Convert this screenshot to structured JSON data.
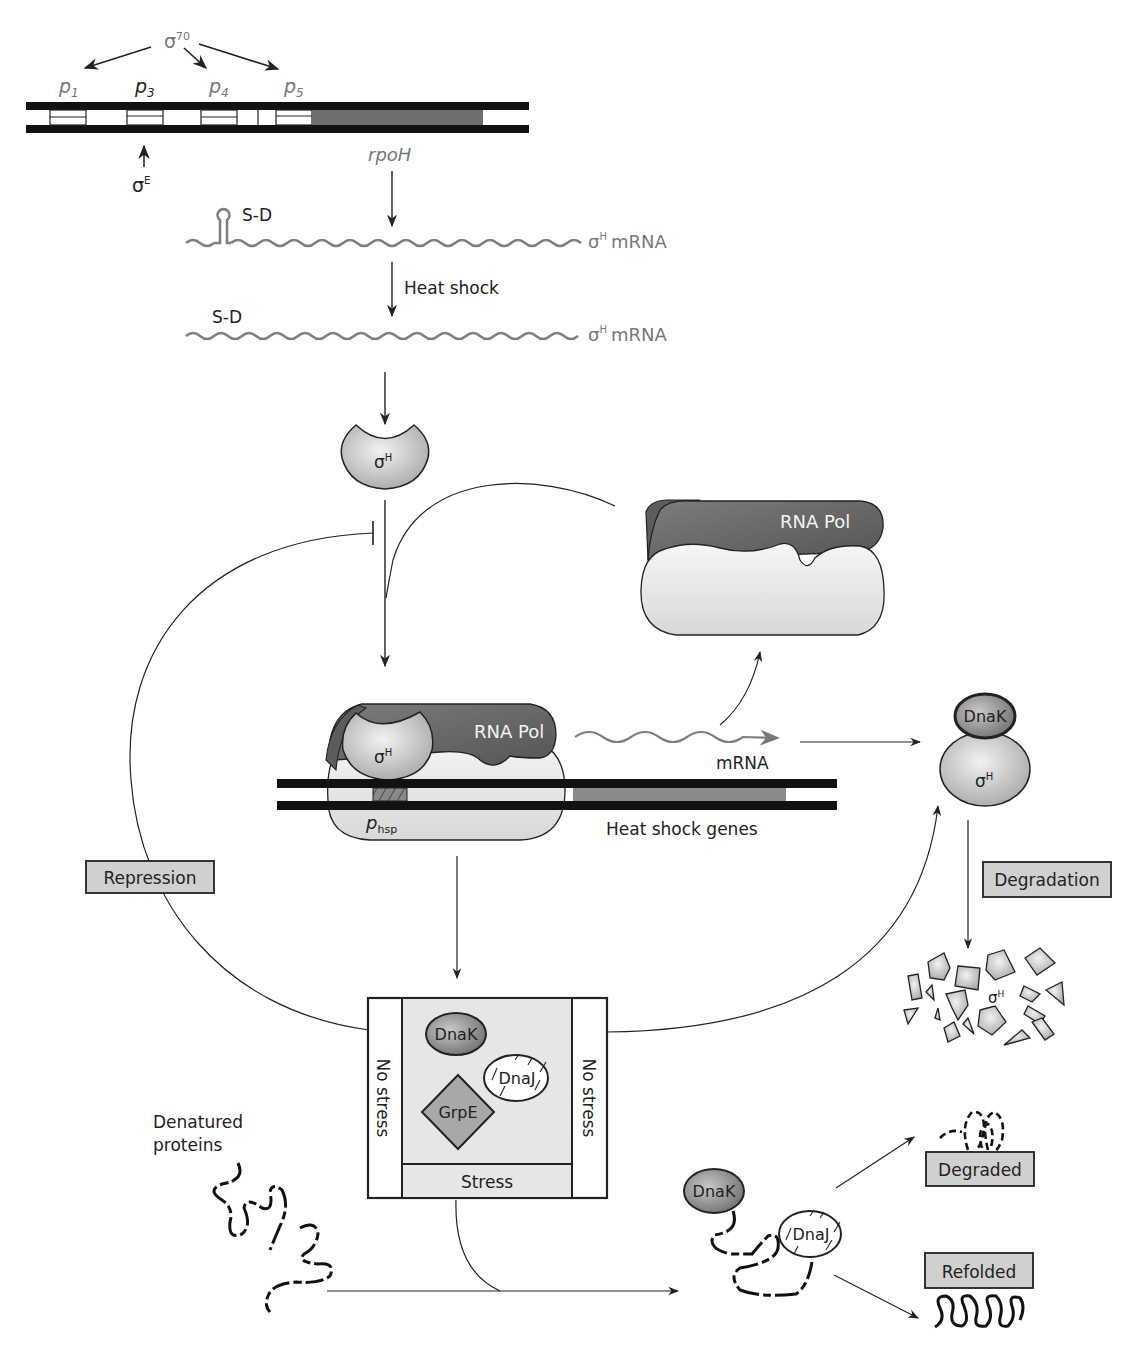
{
  "figure": {
    "colors": {
      "dna_strand": "#111111",
      "gene_fill": "#6e6e6e",
      "heat_shock_gene_fill": "#8a8a8a",
      "protein_light": "#c9c9c9",
      "rna_pol_dark": "#6a6a6a",
      "rna_pol_base": "#e6e6e6",
      "mrna_wave": "#808080",
      "label_box_fill": "#d0d0d0"
    }
  },
  "rpoh_locus": {
    "sigma70": "σ",
    "sigma70_sup": "70",
    "promoters": [
      {
        "p": "p",
        "sub": "1"
      },
      {
        "p": "p",
        "sub": "3"
      },
      {
        "p": "p",
        "sub": "4"
      },
      {
        "p": "p",
        "sub": "5"
      }
    ],
    "sigmaE": "σ",
    "sigmaE_sup": "E",
    "gene_label": "rpoH"
  },
  "mrna_states": {
    "sd_label": "S-D",
    "mrna_label": "mRNA",
    "sigmaH": "σ",
    "sigmaH_sup": "H",
    "heat_shock_label": "Heat shock"
  },
  "sigmaH_protein": {
    "label": "σ",
    "sup": "H"
  },
  "rna_pol_free": {
    "label": "RNA Pol"
  },
  "transcription_complex": {
    "rna_pol_label": "RNA Pol",
    "sigma_label": "σ",
    "sigma_sup": "H",
    "promoter_label": "p",
    "promoter_sub": "hsp",
    "mrna_label": "mRNA",
    "genes_label": "Heat shock genes"
  },
  "dnak_sigma_complex": {
    "dnak": "DnaK",
    "sigma": "σ",
    "sigma_sup": "H"
  },
  "labels": {
    "repression": "Repression",
    "degradation": "Degradation",
    "degraded": "Degraded",
    "refolded": "Refolded"
  },
  "fragments": {
    "sigma": "σ",
    "sup": "H"
  },
  "chaperone_box": {
    "left_side": "No stress",
    "right_side": "No stress",
    "bottom": "Stress",
    "dnak": "DnaK",
    "dnaj": "DnaJ",
    "grpe": "GrpE"
  },
  "denatured": {
    "line1": "Denatured",
    "line2": "proteins"
  },
  "chaperone_complex": {
    "dnak": "DnaK",
    "dnaj": "DnaJ"
  }
}
